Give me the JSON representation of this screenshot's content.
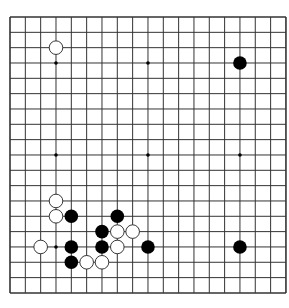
{
  "board": {
    "size": 19,
    "origin_x": 10,
    "origin_y": 17,
    "spacing": 15.33,
    "line_color": "#333333",
    "background": "#ffffff",
    "star_points": [
      [
        3,
        3
      ],
      [
        9,
        3
      ],
      [
        15,
        3
      ],
      [
        3,
        9
      ],
      [
        9,
        9
      ],
      [
        15,
        9
      ],
      [
        3,
        15
      ],
      [
        9,
        15
      ],
      [
        15,
        15
      ]
    ],
    "stones": [
      {
        "color": "white",
        "col": 3,
        "row": 2
      },
      {
        "color": "black",
        "col": 15,
        "row": 3
      },
      {
        "color": "white",
        "col": 3,
        "row": 12
      },
      {
        "color": "white",
        "col": 3,
        "row": 13
      },
      {
        "color": "black",
        "col": 4,
        "row": 13
      },
      {
        "color": "black",
        "col": 7,
        "row": 13
      },
      {
        "color": "black",
        "col": 6,
        "row": 14
      },
      {
        "color": "white",
        "col": 7,
        "row": 14
      },
      {
        "color": "white",
        "col": 8,
        "row": 14
      },
      {
        "color": "white",
        "col": 2,
        "row": 15
      },
      {
        "color": "black",
        "col": 4,
        "row": 15
      },
      {
        "color": "black",
        "col": 6,
        "row": 15
      },
      {
        "color": "white",
        "col": 7,
        "row": 15
      },
      {
        "color": "black",
        "col": 9,
        "row": 15
      },
      {
        "color": "black",
        "col": 15,
        "row": 15
      },
      {
        "color": "black",
        "col": 4,
        "row": 16
      },
      {
        "color": "white",
        "col": 5,
        "row": 16
      },
      {
        "color": "white",
        "col": 6,
        "row": 16
      }
    ]
  }
}
